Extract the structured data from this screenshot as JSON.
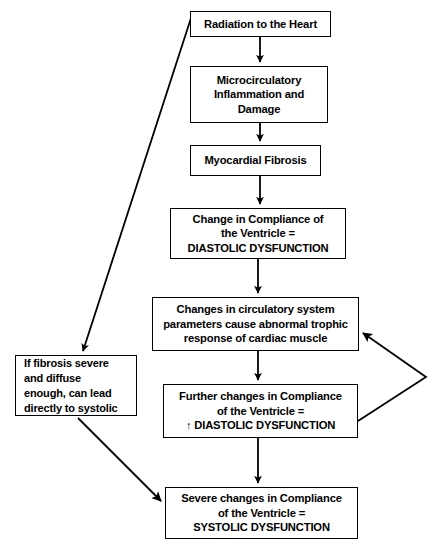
{
  "diagram": {
    "type": "flowchart",
    "nodes": [
      {
        "id": "radiation",
        "label": "Radiation to the Heart"
      },
      {
        "id": "micro",
        "label": "Microcirculatory Inflammation and Damage"
      },
      {
        "id": "fibrosis",
        "label": "Myocardial Fibrosis"
      },
      {
        "id": "diastolic",
        "label": "Change in Compliance of the Ventricle = DIASTOLIC DYSFUNCTION"
      },
      {
        "id": "circulatory",
        "label": "Changes in circulatory system parameters cause abnormal trophic response of cardiac muscle"
      },
      {
        "id": "further",
        "label": "Further changes in Compliance of the Ventricle = ↑ DIASTOLIC DYSFUNCTION"
      },
      {
        "id": "severe",
        "label": "Severe changes in Compliance of the Ventricle = SYSTOLIC DYSFUNCTION"
      },
      {
        "id": "ifsevere",
        "label": "If fibrosis severe and diffuse enough, can lead directly to systolic"
      }
    ],
    "node_lines": {
      "radiation": [
        "Radiation to the Heart"
      ],
      "micro": [
        "Microcirculatory",
        "Inflammation and",
        "Damage"
      ],
      "fibrosis": [
        "Myocardial Fibrosis"
      ],
      "diastolic": [
        "Change in Compliance of",
        "the Ventricle =",
        "DIASTOLIC DYSFUNCTION"
      ],
      "circulatory": [
        "Changes in circulatory system",
        "parameters cause abnormal trophic",
        "response of cardiac muscle"
      ],
      "further": [
        "Further changes in Compliance",
        "of the Ventricle =",
        "↑ DIASTOLIC DYSFUNCTION"
      ],
      "severe": [
        "Severe changes in Compliance",
        "of the Ventricle =",
        "SYSTOLIC DYSFUNCTION"
      ],
      "ifsevere": [
        "If fibrosis severe",
        "and diffuse",
        "enough, can lead",
        "directly to systolic"
      ]
    },
    "edges": [
      {
        "from": "radiation",
        "to": "micro",
        "style": "straight-down"
      },
      {
        "from": "micro",
        "to": "fibrosis",
        "style": "straight-down"
      },
      {
        "from": "fibrosis",
        "to": "diastolic",
        "style": "straight-down"
      },
      {
        "from": "diastolic",
        "to": "circulatory",
        "style": "straight-down"
      },
      {
        "from": "circulatory",
        "to": "further",
        "style": "straight-down"
      },
      {
        "from": "further",
        "to": "severe",
        "style": "straight-down"
      },
      {
        "from": "radiation",
        "to": "ifsevere",
        "style": "diagonal"
      },
      {
        "from": "ifsevere",
        "to": "severe",
        "style": "diagonal"
      },
      {
        "from": "further",
        "to": "circulatory",
        "style": "feedback-loop-right"
      }
    ],
    "colors": {
      "stroke": "#000000",
      "fill": "#ffffff",
      "text": "#000000"
    }
  }
}
